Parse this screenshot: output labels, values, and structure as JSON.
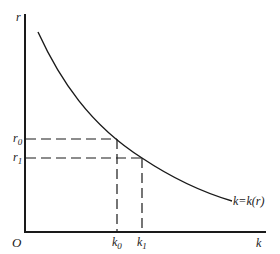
{
  "diagram": {
    "type": "demand-curve",
    "axes": {
      "y_label": "r",
      "x_label": "k",
      "origin_label": "O"
    },
    "curve_label": "k=k(r)",
    "points": [
      {
        "r_label": "r",
        "r_sub": "0",
        "k_label": "k",
        "k_sub": "0"
      },
      {
        "r_label": "r",
        "r_sub": "1",
        "k_label": "k",
        "k_sub": "1"
      }
    ],
    "colors": {
      "ink": "#1a1a1a",
      "background": "#ffffff"
    }
  }
}
